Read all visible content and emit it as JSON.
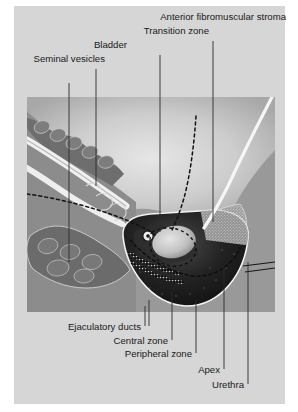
{
  "figure": {
    "frame_color": "#d6d6d6",
    "panel_color": "#999999",
    "page_background": "#ffffff"
  },
  "labels": {
    "anterior_fibromuscular_stroma": "Anterior fibromuscular stroma",
    "transition_zone": "Transition zone",
    "bladder": "Bladder",
    "seminal_vesicles": "Seminal vesicles",
    "ejaculatory_ducts": "Ejaculatory ducts",
    "central_zone": "Central zone",
    "peripheral_zone": "Peripheral zone",
    "apex": "Apex",
    "urethra": "Urethra"
  },
  "structures": {
    "bladder_fill": "#c8c8c8",
    "prostate_fill": "#1c1c1c",
    "seminal_vesicle_fill": "#737373",
    "stroma_hatch": "#b4b4b4",
    "duct_white": "#f2f2f2",
    "transition_zone_fill": "#cfcfcf",
    "leader_line_color": "#2b2b2b",
    "dashed_boundary_color": "#151515"
  }
}
